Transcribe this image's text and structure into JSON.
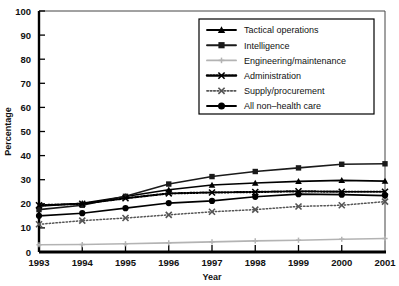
{
  "chart_data": {
    "type": "line",
    "title": "",
    "xlabel": "Year",
    "ylabel": "Percentage",
    "x": [
      1993,
      1994,
      1995,
      1996,
      1997,
      1998,
      1999,
      2000,
      2001
    ],
    "xtick_labels": [
      "1993",
      "1994",
      "1995",
      "1996",
      "1997",
      "1998",
      "1999",
      "2000",
      "2001"
    ],
    "ytick_labels": [
      "0",
      "10",
      "20",
      "30",
      "40",
      "50",
      "60",
      "70",
      "80",
      "90",
      "100"
    ],
    "ylim": [
      0,
      100
    ],
    "xlim": [
      1993,
      2001
    ],
    "grid": false,
    "legend_position": "upper-right",
    "series": [
      {
        "name": "Tactical operations",
        "marker": "triangle",
        "linestyle": "solid",
        "color": "#000000",
        "values": [
          19.0,
          20.2,
          23.0,
          25.8,
          27.8,
          28.6,
          29.3,
          29.7,
          29.4
        ]
      },
      {
        "name": "Intelligence",
        "marker": "square",
        "linestyle": "solid",
        "color": "#1a1a1a",
        "values": [
          17.6,
          19.4,
          23.1,
          28.2,
          31.3,
          33.4,
          34.9,
          36.4,
          36.6
        ]
      },
      {
        "name": "Engineering/maintenance",
        "marker": "plus",
        "linestyle": "solid",
        "color": "#b3b3b3",
        "values": [
          3.0,
          3.1,
          3.4,
          3.8,
          4.2,
          4.6,
          4.9,
          5.3,
          5.6
        ]
      },
      {
        "name": "Administration",
        "marker": "x",
        "linestyle": "dotted-bold",
        "color": "#000000",
        "values": [
          19.4,
          20.0,
          22.3,
          24.3,
          24.7,
          24.9,
          25.2,
          25.0,
          25.0
        ]
      },
      {
        "name": "Supply/procurement",
        "marker": "x",
        "linestyle": "dotted-light",
        "color": "#555555",
        "values": [
          11.5,
          13.0,
          14.1,
          15.4,
          16.7,
          17.6,
          18.9,
          19.4,
          20.9
        ]
      },
      {
        "name": "All non–health care",
        "marker": "circle",
        "linestyle": "solid",
        "color": "#000000",
        "values": [
          15.0,
          16.1,
          18.2,
          20.3,
          21.2,
          22.9,
          24.0,
          23.8,
          23.4
        ]
      }
    ]
  },
  "legend": {
    "entries": [
      {
        "label": "Tactical operations"
      },
      {
        "label": "Intelligence"
      },
      {
        "label": "Engineering/maintenance"
      },
      {
        "label": "Administration"
      },
      {
        "label": "Supply/procurement"
      },
      {
        "label": "All non–health care"
      }
    ]
  }
}
